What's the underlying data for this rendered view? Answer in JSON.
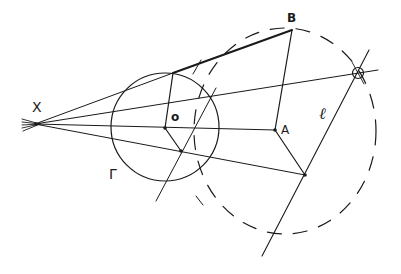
{
  "diagram": {
    "labels": {
      "X": "X",
      "B": "B",
      "A": "A",
      "O": "o",
      "Gamma": "Γ",
      "ell": "ℓ"
    },
    "colors": {
      "stroke": "#1a1a1a",
      "background": "#ffffff"
    },
    "points": {
      "X": [
        35,
        124
      ],
      "O": [
        165,
        128
      ],
      "A": [
        275,
        130
      ],
      "B": [
        292,
        30
      ],
      "T": [
        173,
        73
      ],
      "P": [
        181,
        151
      ],
      "Q": [
        305,
        175
      ],
      "R": [
        358,
        73
      ]
    },
    "circles": {
      "Gamma": {
        "cx": 165,
        "cy": 127,
        "r": 54,
        "style": "solid"
      },
      "dashed": {
        "cx": 285,
        "cy": 131,
        "rx": 91,
        "ry": 103,
        "style": "dashed"
      }
    },
    "lines": {
      "ell": {
        "from": [
          369,
          50
        ],
        "to": [
          262,
          256
        ]
      },
      "through_gamma": {
        "from": [
          216,
          88
        ],
        "to": [
          156,
          201
        ]
      }
    }
  }
}
